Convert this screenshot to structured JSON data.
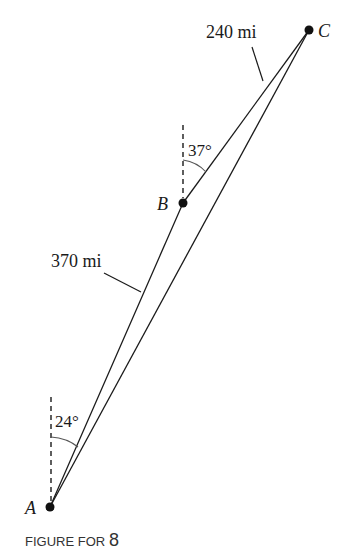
{
  "figure": {
    "caption_prefix": "FIGURE FOR",
    "caption_number": "8"
  },
  "points": {
    "A": {
      "label": "A",
      "x": 50,
      "y": 507
    },
    "B": {
      "label": "B",
      "x": 183,
      "y": 203
    },
    "C": {
      "label": "C",
      "x": 309,
      "y": 30
    }
  },
  "segments": {
    "AB": {
      "length_label": "370 mi"
    },
    "BC": {
      "length_label": "240 mi"
    }
  },
  "angles": {
    "at_A": {
      "label": "24°"
    },
    "at_B": {
      "label": "37°"
    }
  },
  "colors": {
    "line": "#1a1a1a",
    "background": "#ffffff"
  }
}
